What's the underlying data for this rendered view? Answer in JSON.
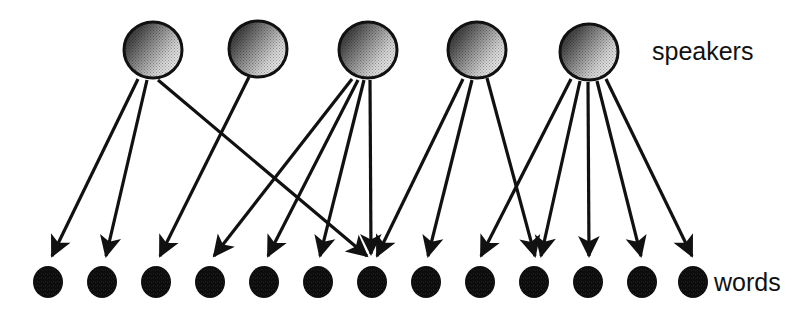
{
  "diagram": {
    "background_color": "#ffffff",
    "line_color": "#111111",
    "word_node_color": "#0d0d0d",
    "speaker_node_outline_color": "#111111",
    "speaker_node_fill_dark": "#3a3a3a",
    "speaker_node_fill_light": "#f0f0f0",
    "labels": {
      "speakers": "speakers",
      "words": "words"
    },
    "speakers": {
      "count": 5,
      "radius_x": 29,
      "radius_y": 28,
      "cy": 50,
      "nodes": [
        {
          "id": "speaker-1",
          "cx": 153,
          "cy": 50
        },
        {
          "id": "speaker-2",
          "cx": 258,
          "cy": 49
        },
        {
          "id": "speaker-3",
          "cx": 368,
          "cy": 50
        },
        {
          "id": "speaker-4",
          "cx": 477,
          "cy": 50
        },
        {
          "id": "speaker-5",
          "cx": 589,
          "cy": 52
        }
      ]
    },
    "words": {
      "count": 13,
      "radius": 15,
      "cy": 282,
      "nodes": [
        {
          "id": "word-1",
          "cx": 48,
          "cy": 282
        },
        {
          "id": "word-2",
          "cx": 102,
          "cy": 282
        },
        {
          "id": "word-3",
          "cx": 156,
          "cy": 282
        },
        {
          "id": "word-4",
          "cx": 210,
          "cy": 282
        },
        {
          "id": "word-5",
          "cx": 264,
          "cy": 282
        },
        {
          "id": "word-6",
          "cx": 318,
          "cy": 282
        },
        {
          "id": "word-7",
          "cx": 372,
          "cy": 282
        },
        {
          "id": "word-8",
          "cx": 426,
          "cy": 282
        },
        {
          "id": "word-9",
          "cx": 480,
          "cy": 282
        },
        {
          "id": "word-10",
          "cx": 534,
          "cy": 282
        },
        {
          "id": "word-11",
          "cx": 588,
          "cy": 282
        },
        {
          "id": "word-12",
          "cx": 642,
          "cy": 282
        },
        {
          "id": "word-13",
          "cx": 693,
          "cy": 282
        }
      ]
    },
    "edges": [
      {
        "id": "edge-s1-w1",
        "from": 0,
        "to": 0,
        "x1": 138,
        "y1": 79,
        "x2": 52,
        "y2": 256
      },
      {
        "id": "edge-s1-w2",
        "from": 0,
        "to": 1,
        "x1": 147,
        "y1": 80,
        "x2": 106,
        "y2": 256
      },
      {
        "id": "edge-s1-w7",
        "from": 0,
        "to": 6,
        "x1": 158,
        "y1": 80,
        "x2": 367,
        "y2": 256
      },
      {
        "id": "edge-s2-w3",
        "from": 1,
        "to": 2,
        "x1": 249,
        "y1": 77,
        "x2": 160,
        "y2": 256
      },
      {
        "id": "edge-s3-w4",
        "from": 2,
        "to": 3,
        "x1": 352,
        "y1": 79,
        "x2": 214,
        "y2": 256
      },
      {
        "id": "edge-s3-w5",
        "from": 2,
        "to": 4,
        "x1": 358,
        "y1": 80,
        "x2": 268,
        "y2": 256
      },
      {
        "id": "edge-s3-w6",
        "from": 2,
        "to": 5,
        "x1": 364,
        "y1": 80,
        "x2": 320,
        "y2": 256
      },
      {
        "id": "edge-s3-w7",
        "from": 2,
        "to": 6,
        "x1": 370,
        "y1": 80,
        "x2": 371,
        "y2": 254
      },
      {
        "id": "edge-s4-w7",
        "from": 3,
        "to": 6,
        "x1": 463,
        "y1": 79,
        "x2": 377,
        "y2": 256
      },
      {
        "id": "edge-s4-w8",
        "from": 3,
        "to": 7,
        "x1": 472,
        "y1": 80,
        "x2": 428,
        "y2": 256
      },
      {
        "id": "edge-s4-w10",
        "from": 3,
        "to": 9,
        "x1": 487,
        "y1": 78,
        "x2": 535,
        "y2": 256
      },
      {
        "id": "edge-s5-w9",
        "from": 4,
        "to": 8,
        "x1": 571,
        "y1": 79,
        "x2": 481,
        "y2": 256
      },
      {
        "id": "edge-s5-w10",
        "from": 4,
        "to": 9,
        "x1": 580,
        "y1": 81,
        "x2": 541,
        "y2": 256
      },
      {
        "id": "edge-s5-w11",
        "from": 4,
        "to": 10,
        "x1": 588,
        "y1": 82,
        "x2": 589,
        "y2": 256
      },
      {
        "id": "edge-s5-w12",
        "from": 4,
        "to": 11,
        "x1": 597,
        "y1": 81,
        "x2": 641,
        "y2": 256
      },
      {
        "id": "edge-s5-w13",
        "from": 4,
        "to": 12,
        "x1": 606,
        "y1": 79,
        "x2": 692,
        "y2": 256
      }
    ]
  }
}
